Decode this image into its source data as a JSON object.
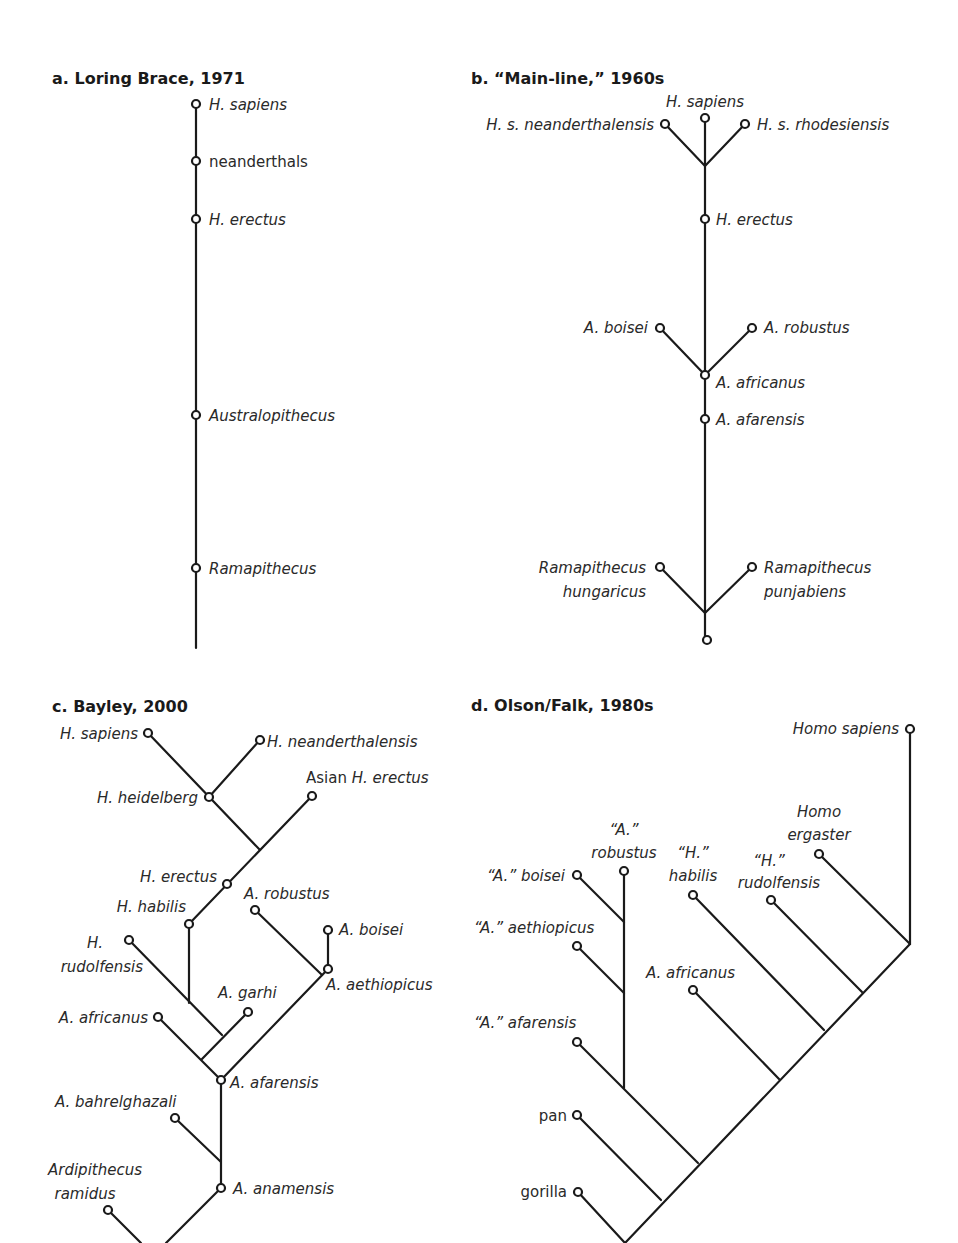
{
  "figure": {
    "panels": [
      {
        "id": "a",
        "title": "a. Loring Brace, 1971",
        "taxa": [
          "H. sapiens",
          "neanderthals",
          "H. erectus",
          "Australopithecus",
          "Ramapithecus"
        ]
      },
      {
        "id": "b",
        "title": "b. “Main-line,” 1960s",
        "taxa": [
          "H. sapiens",
          "H. s. neanderthalensis",
          "H. s. rhodesiensis",
          "H. erectus",
          "A. boisei",
          "A. robustus",
          "A. africanus",
          "A. afarensis",
          "Ramapithecus hungaricus",
          "Ramapithecus punjabiens"
        ],
        "labels": {
          "h_sapiens": "H. sapiens",
          "neanderthalensis": "H. s. neanderthalensis",
          "rhodesiensis": "H. s. rhodesiensis",
          "h_erectus": "H. erectus",
          "a_boisei": "A. boisei",
          "a_robustus": "A. robustus",
          "a_africanus": "A. africanus",
          "a_afarensis": "A. afarensis",
          "rama_hung_1": "Ramapithecus",
          "rama_hung_2": "hungaricus",
          "rama_punj_1": "Ramapithecus",
          "rama_punj_2": "punjabiens"
        }
      },
      {
        "id": "c",
        "title": "c. Bayley, 2000",
        "labels": {
          "h_sapiens": "H. sapiens",
          "h_neanderthalensis": "H. neanderthalensis",
          "asian_prefix": "Asian ",
          "asian_h_erectus": "H. erectus",
          "h_heidelberg": "H. heidelberg",
          "h_erectus": "H. erectus",
          "a_robustus": "A. robustus",
          "h_habilis": "H. habilis",
          "a_boisei": "A. boisei",
          "h_rudolfensis_1": "H.",
          "h_rudolfensis_2": "rudolfensis",
          "a_aethiopicus": "A. aethiopicus",
          "a_garhi": "A. garhi",
          "a_africanus": "A. africanus",
          "a_afarensis": "A. afarensis",
          "a_bahrelghazali": "A. bahrelghazali",
          "ardipithecus_1": "Ardipithecus",
          "ardipithecus_2": "ramidus",
          "a_anamensis": "A. anamensis"
        }
      },
      {
        "id": "d",
        "title": "d. Olson/Falk, 1980s",
        "labels": {
          "homo_sapiens": "Homo sapiens",
          "homo_ergaster_1": "Homo",
          "homo_ergaster_2": "ergaster",
          "robustus_1": "“A.”",
          "robustus_2": "robustus",
          "habilis_1": "“H.”",
          "habilis_2": "habilis",
          "rudolfensis_1": "“H.”",
          "rudolfensis_2": "rudolfensis",
          "boisei": "“A.” boisei",
          "aethiopicus": "“A.” aethiopicus",
          "africanus": "A. africanus",
          "afarensis": "“A.” afarensis",
          "pan": "pan",
          "gorilla": "gorilla"
        }
      }
    ]
  }
}
